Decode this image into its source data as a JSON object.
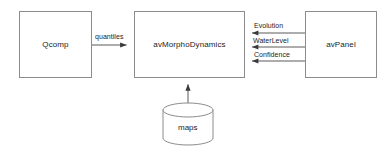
{
  "diagram": {
    "background_color": "#ffffff",
    "stroke_color": "#8c8c8c",
    "arrow_color": "#3a3a3a",
    "text_color": "#1c1c1c",
    "nodes": [
      {
        "id": "qcomp",
        "label": "Qcomp",
        "shape": "rectangle"
      },
      {
        "id": "avmorphodynamics",
        "label": "avMorphoDynamics",
        "shape": "rectangle"
      },
      {
        "id": "avpanel",
        "label": "avPanel",
        "shape": "rectangle"
      },
      {
        "id": "maps",
        "label": "maps",
        "shape": "cylinder"
      }
    ],
    "edges": [
      {
        "id": "quantiles",
        "label": "quantiles",
        "from": "qcomp",
        "to": "avmorphodynamics",
        "direction": "right"
      },
      {
        "id": "evolution",
        "label": "Evolution",
        "from": "avpanel",
        "to": "avmorphodynamics",
        "direction": "left"
      },
      {
        "id": "waterlevel",
        "label": "WaterLevel",
        "from": "avpanel",
        "to": "avmorphodynamics",
        "direction": "left"
      },
      {
        "id": "confidence",
        "label": "Confidence",
        "from": "avpanel",
        "to": "avmorphodynamics",
        "direction": "left"
      },
      {
        "id": "maps-feed",
        "label": "",
        "from": "maps",
        "to": "avmorphodynamics",
        "direction": "up"
      }
    ]
  }
}
